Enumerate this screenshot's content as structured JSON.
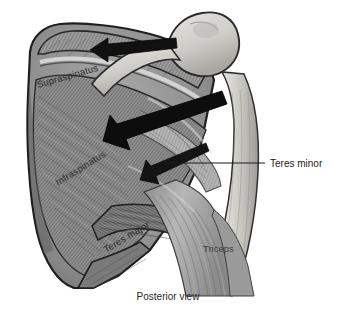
{
  "figure": {
    "view_caption": "Posterior view",
    "background_color": "#ffffff",
    "ink_color": "#1c1c1c",
    "style": "grayscale anatomical line-and-tone illustration"
  },
  "labels": {
    "supraspinatus": "Supraspinatus",
    "infraspinatus": "Infraspinatus",
    "teres_major": "Teres major",
    "teres_minor": "Teres minor",
    "triceps": "Triceps"
  },
  "caption": {
    "text": "Posterior view"
  },
  "callouts": [
    {
      "label": "Teres minor",
      "has_leader_line": true,
      "leader_orientation": "horizontal"
    }
  ],
  "arrows": [
    {
      "name": "supraspinatus-pull-arrow",
      "direction": "left",
      "style": "solid-filled",
      "color": "#111111"
    },
    {
      "name": "infraspinatus-pull-arrow",
      "direction": "left-down",
      "style": "solid-filled-large",
      "color": "#0d0d0d"
    },
    {
      "name": "teres-minor-pull-arrow",
      "direction": "left-down",
      "style": "outline-slender",
      "color": "#141414"
    }
  ],
  "structures": [
    {
      "name": "scapula",
      "tone": "mid-gray"
    },
    {
      "name": "humeral-head",
      "tone": "light-gray"
    },
    {
      "name": "humerus-shaft",
      "tone": "light-gray"
    },
    {
      "name": "supraspinatus-muscle",
      "tone": "mid-gray striated"
    },
    {
      "name": "infraspinatus-muscle",
      "tone": "mid-gray striated"
    },
    {
      "name": "teres-minor-muscle",
      "tone": "light-gray striated"
    },
    {
      "name": "teres-major-muscle",
      "tone": "dark-gray striated"
    },
    {
      "name": "triceps-muscle",
      "tone": "mid-gray striated"
    }
  ]
}
